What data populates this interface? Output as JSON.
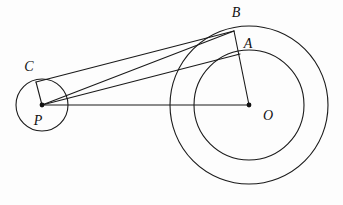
{
  "figure": {
    "background_color": "#fdfdfd",
    "stroke_color": "#1a1a1a",
    "width": 343,
    "height": 205
  },
  "labels": {
    "A": "A",
    "B": "B",
    "C": "C",
    "O": "O",
    "P": "P"
  },
  "chart_data": {
    "type": "diagram",
    "xlim": [
      0,
      343
    ],
    "ylim": [
      0,
      205
    ],
    "grid": false,
    "legend": null,
    "circles": [
      {
        "name": "outer-circle-O",
        "center_label": "O",
        "cx": 249,
        "cy": 105,
        "r": 79
      },
      {
        "name": "inner-circle-O",
        "center_label": "O",
        "cx": 249,
        "cy": 105,
        "r": 55
      },
      {
        "name": "circle-P",
        "center_label": "P",
        "cx": 42,
        "cy": 105,
        "r": 26
      }
    ],
    "points": [
      {
        "label": "A",
        "x": 240,
        "y": 54,
        "label_x": 248,
        "label_y": 45,
        "dot": false
      },
      {
        "label": "B",
        "x": 234,
        "y": 31,
        "label_x": 236,
        "label_y": 14,
        "dot": false
      },
      {
        "label": "C",
        "x": 36,
        "y": 82,
        "label_x": 29,
        "label_y": 68,
        "dot": false
      },
      {
        "label": "O",
        "x": 249,
        "y": 105,
        "label_x": 268,
        "label_y": 117,
        "dot": true
      },
      {
        "label": "P",
        "x": 42,
        "y": 105,
        "label_x": 38,
        "label_y": 122,
        "dot": true
      }
    ],
    "segments": [
      {
        "name": "segment-PO",
        "from": "P",
        "to": "O",
        "x1": 42,
        "y1": 105,
        "x2": 249,
        "y2": 105
      },
      {
        "name": "segment-PC",
        "from": "P",
        "to": "C",
        "x1": 42,
        "y1": 105,
        "x2": 36,
        "y2": 82
      },
      {
        "name": "segment-CB",
        "from": "C",
        "to": "B",
        "x1": 36,
        "y1": 82,
        "x2": 234,
        "y2": 31
      },
      {
        "name": "segment-PB",
        "from": "P",
        "to": "B",
        "x1": 42,
        "y1": 105,
        "x2": 234,
        "y2": 31
      },
      {
        "name": "segment-PA",
        "from": "P",
        "to": "A",
        "x1": 42,
        "y1": 105,
        "x2": 240,
        "y2": 54
      },
      {
        "name": "segment-OB",
        "from": "O",
        "to": "B",
        "x1": 249,
        "y1": 105,
        "x2": 234,
        "y2": 31
      }
    ]
  }
}
